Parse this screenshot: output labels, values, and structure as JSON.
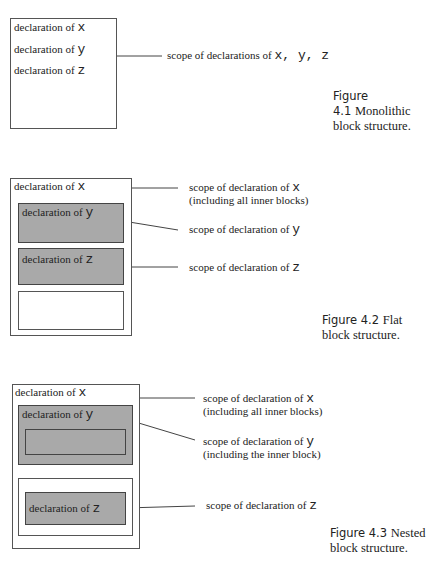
{
  "figures": [
    {
      "caption": {
        "number": "Figure 4.1",
        "title_line1": "Monolithic",
        "title_line2": "block structure."
      },
      "blocks": [
        {
          "lines": [
            {
              "prefix": "declaration of ",
              "var": "x"
            },
            {
              "prefix": "declaration of ",
              "var": "y"
            },
            {
              "prefix": "declaration of ",
              "var": "z"
            }
          ]
        }
      ],
      "labels": [
        {
          "prefix": "scope of declarations of ",
          "vars": "x, y, z"
        }
      ]
    },
    {
      "caption": {
        "number": "Figure 4.2",
        "title_line1": "Flat",
        "title_line2": "block structure."
      },
      "blocks": [
        {
          "prefix": "declaration of ",
          "var": "x"
        },
        {
          "prefix": "declaration of ",
          "var": "y"
        },
        {
          "prefix": "declaration of ",
          "var": "z"
        }
      ],
      "labels": [
        {
          "prefix": "scope of declaration of ",
          "var": "x",
          "line2": "(including all inner blocks)"
        },
        {
          "prefix": "scope of declaration of ",
          "var": "y"
        },
        {
          "prefix": "scope of declaration of ",
          "var": "z"
        }
      ]
    },
    {
      "caption": {
        "number": "Figure 4.3",
        "title_line1": "Nested",
        "title_line2": "block structure."
      },
      "blocks": [
        {
          "prefix": "declaration of ",
          "var": "x"
        },
        {
          "prefix": "declaration of ",
          "var": "y"
        },
        {
          "prefix": "declaration of ",
          "var": "z"
        }
      ],
      "labels": [
        {
          "prefix": "scope of declaration of ",
          "var": "x",
          "line2": "(including all inner blocks)"
        },
        {
          "prefix": "scope of declaration of ",
          "var": "y",
          "line2": "(including the inner block)"
        },
        {
          "prefix": "scope of declaration of ",
          "var": "z"
        }
      ]
    }
  ]
}
